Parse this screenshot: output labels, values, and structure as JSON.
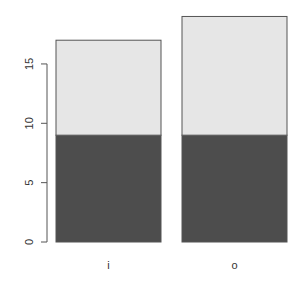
{
  "chart_data": {
    "type": "bar",
    "stacked": true,
    "title": "",
    "xlabel": "",
    "ylabel": "",
    "categories": [
      "i",
      "o"
    ],
    "series": [
      {
        "name": "segment-1",
        "color": "#4d4d4d",
        "values": [
          9,
          9
        ]
      },
      {
        "name": "segment-2",
        "color": "#e6e6e6",
        "values": [
          8,
          10
        ]
      }
    ],
    "totals": [
      17,
      19
    ],
    "ylim": [
      0,
      19
    ],
    "yticks": [
      0,
      5,
      10,
      15
    ],
    "ytick_labels": [
      "0",
      "5",
      "10",
      "15"
    ],
    "grid": false,
    "legend": null
  },
  "colors": {
    "dark": "#4d4d4d",
    "light": "#e6e6e6",
    "border": "#555555",
    "axis": "#555555"
  }
}
